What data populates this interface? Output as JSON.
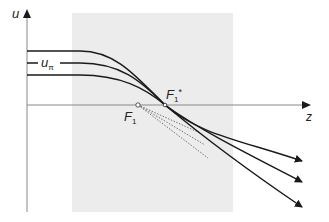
{
  "diagram": {
    "axes": {
      "y_label": "u",
      "x_label": "z"
    },
    "labels": {
      "u_pi": {
        "main": "u",
        "sub": "π"
      },
      "F1_star": {
        "main": "F",
        "sub": "1",
        "sup": "*"
      },
      "F1": {
        "main": "F",
        "sub": "1"
      }
    },
    "colors": {
      "shaded_region": "#ececec",
      "axis": "#888888",
      "curve": "#1a1a1a",
      "dotted": "#666666"
    }
  }
}
